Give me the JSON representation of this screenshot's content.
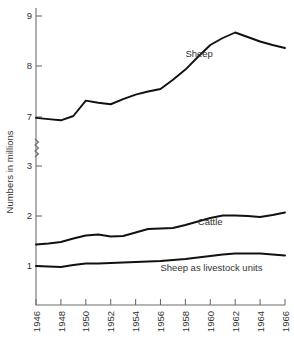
{
  "chart_data": {
    "type": "line",
    "title": "",
    "xlabel": "",
    "ylabel": "Numbers in millions",
    "x": [
      1946,
      1947,
      1948,
      1949,
      1950,
      1951,
      1952,
      1953,
      1954,
      1955,
      1956,
      1957,
      1958,
      1959,
      1960,
      1961,
      1962,
      1963,
      1964,
      1965,
      1966
    ],
    "xtick_labels": [
      "1946",
      "1948",
      "1950",
      "1952",
      "1954",
      "1956",
      "1958",
      "1960",
      "1962",
      "1964",
      "1966"
    ],
    "xticks": [
      1946,
      1948,
      1950,
      1952,
      1954,
      1956,
      1958,
      1960,
      1962,
      1964,
      1966
    ],
    "ytick_labels": [
      "9",
      "8",
      "7",
      "3",
      "2",
      "1"
    ],
    "yticks": [
      9,
      8,
      7,
      3,
      2,
      1
    ],
    "axis_break": {
      "between": [
        7,
        3
      ],
      "style": "zigzag"
    },
    "xlim": [
      1946,
      1966
    ],
    "grid": false,
    "legend": "inline-annotations",
    "series": [
      {
        "name": "Sheep",
        "label": "Sheep",
        "label_x": 1958,
        "label_y": 8.18,
        "values": [
          6.93,
          6.83,
          6.73,
          7.02,
          7.32,
          7.28,
          7.25,
          7.35,
          7.44,
          7.5,
          7.55,
          7.73,
          7.93,
          8.18,
          8.42,
          8.56,
          8.67,
          8.58,
          8.49,
          8.42,
          8.36
        ]
      },
      {
        "name": "Cattle",
        "label": "Cattle",
        "label_x": 1959,
        "label_y": 1.83,
        "values": [
          1.43,
          1.45,
          1.48,
          1.55,
          1.61,
          1.63,
          1.59,
          1.6,
          1.67,
          1.74,
          1.75,
          1.76,
          1.82,
          1.89,
          1.96,
          2.01,
          2.01,
          2.0,
          1.98,
          2.02,
          2.07
        ]
      },
      {
        "name": "Sheep as livestock units",
        "label": "Sheep as  livestock units",
        "label_x": 1956,
        "label_y": 0.9,
        "values": [
          1.0,
          0.99,
          0.98,
          1.02,
          1.05,
          1.05,
          1.06,
          1.07,
          1.08,
          1.09,
          1.1,
          1.12,
          1.14,
          1.17,
          1.2,
          1.23,
          1.25,
          1.25,
          1.25,
          1.23,
          1.21
        ]
      }
    ],
    "colors": {
      "line": "#111111",
      "axis": "#6f6f6f",
      "text": "#333333",
      "background": "#ffffff"
    }
  },
  "geometry": {
    "plot_left": 36,
    "plot_right": 285,
    "plot_bottom": 305,
    "y_map": [
      {
        "value": 9,
        "py": 16
      },
      {
        "value": 8,
        "py": 66
      },
      {
        "value": 7,
        "py": 117
      },
      {
        "value": 3,
        "py": 166
      },
      {
        "value": 2,
        "py": 216
      },
      {
        "value": 1,
        "py": 266
      }
    ],
    "break_py": 148,
    "axis_top": 8
  }
}
